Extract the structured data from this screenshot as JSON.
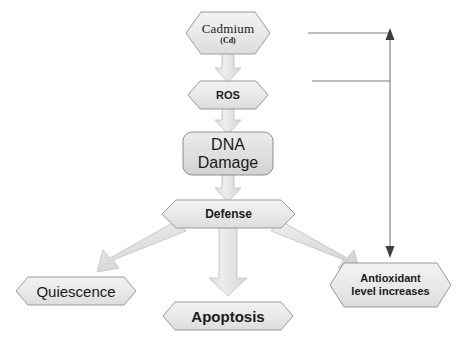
{
  "diagram": {
    "style": {
      "node_fill_light": "#ededed",
      "node_fill_mid": "#e2e2e2",
      "node_stroke": "#9a9a9a",
      "arrow_fill": "#e4e4e4",
      "arrow_stroke": "#b5b5b5",
      "feedback_line": "#6f6f6f",
      "text_color": "#1a1a1a",
      "background": "#ffffff"
    },
    "nodes": [
      {
        "id": "cadmium",
        "shape": "hexagon",
        "label": "Cadmium",
        "sublabel": "(Cd)"
      },
      {
        "id": "ros",
        "shape": "hexagon",
        "label": "ROS"
      },
      {
        "id": "dna_damage",
        "shape": "rounded-rectangle",
        "label_line1": "DNA",
        "label_line2": "Damage"
      },
      {
        "id": "defense",
        "shape": "hexagon",
        "label": "Defense"
      },
      {
        "id": "quiescence",
        "shape": "flat-hexagon",
        "label": "Quiescence"
      },
      {
        "id": "apoptosis",
        "shape": "flat-hexagon",
        "label": "Apoptosis"
      },
      {
        "id": "antioxidant",
        "shape": "hexagon",
        "label_line1": "Antioxidant",
        "label_line2": "level increases"
      }
    ],
    "connectors": [
      {
        "id": "cadmium-to-ros",
        "kind": "block-arrow-down",
        "from": "cadmium",
        "to": "ros"
      },
      {
        "id": "ros-to-dna",
        "kind": "block-arrow-down",
        "from": "ros",
        "to": "dna_damage"
      },
      {
        "id": "dna-to-defense",
        "kind": "block-arrow-down",
        "from": "dna_damage",
        "to": "defense"
      },
      {
        "id": "defense-to-quiescence",
        "kind": "block-arrow-diagonal-left",
        "from": "defense",
        "to": "quiescence"
      },
      {
        "id": "defense-to-apoptosis",
        "kind": "block-arrow-down",
        "from": "defense",
        "to": "apoptosis"
      },
      {
        "id": "defense-to-antioxidant",
        "kind": "block-arrow-diagonal-right",
        "from": "defense",
        "to": "antioxidant"
      },
      {
        "id": "feedback-loop",
        "kind": "double-headed-line-arrow",
        "from": "antioxidant",
        "to": "cadmium-ros-branch"
      }
    ]
  }
}
